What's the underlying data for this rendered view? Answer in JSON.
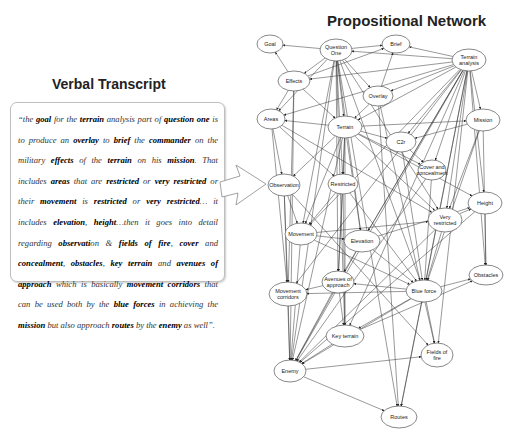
{
  "verbal_transcript": {
    "title": "Verbal Transcript",
    "segments": [
      {
        "t": "“the ",
        "b": false
      },
      {
        "t": "goal",
        "b": true
      },
      {
        "t": " for the ",
        "b": false
      },
      {
        "t": "terrain",
        "b": true
      },
      {
        "t": " analysis part of ",
        "b": false
      },
      {
        "t": "question one",
        "b": true
      },
      {
        "t": " is to produce an ",
        "b": false
      },
      {
        "t": "overlay",
        "b": true
      },
      {
        "t": " to ",
        "b": false
      },
      {
        "t": "brief",
        "b": true
      },
      {
        "t": " the ",
        "b": false
      },
      {
        "t": "commander",
        "b": true
      },
      {
        "t": " on the military ",
        "b": false
      },
      {
        "t": "effects",
        "b": true
      },
      {
        "t": " of the ",
        "b": false
      },
      {
        "t": "terrain",
        "b": true
      },
      {
        "t": " on his ",
        "b": false
      },
      {
        "t": "mission",
        "b": true
      },
      {
        "t": ". That includes ",
        "b": false
      },
      {
        "t": "areas",
        "b": true
      },
      {
        "t": " that are ",
        "b": false
      },
      {
        "t": "restricted",
        "b": true
      },
      {
        "t": " or ",
        "b": false
      },
      {
        "t": "very restricted",
        "b": true
      },
      {
        "t": " or their ",
        "b": false
      },
      {
        "t": "movement",
        "b": true
      },
      {
        "t": " is ",
        "b": false
      },
      {
        "t": "restricted",
        "b": true
      },
      {
        "t": " or ",
        "b": false
      },
      {
        "t": "very restricted",
        "b": true
      },
      {
        "t": "… it includes ",
        "b": false
      },
      {
        "t": "elevation",
        "b": true
      },
      {
        "t": ", ",
        "b": false
      },
      {
        "t": "height",
        "b": true
      },
      {
        "t": "…then it goes into detail regarding ",
        "b": false
      },
      {
        "t": "observati",
        "b": true
      },
      {
        "t": "on & ",
        "b": false
      },
      {
        "t": "fields of fire",
        "b": true
      },
      {
        "t": ", ",
        "b": false
      },
      {
        "t": "cover",
        "b": true
      },
      {
        "t": " and ",
        "b": false
      },
      {
        "t": "concealment",
        "b": true
      },
      {
        "t": ", ",
        "b": false
      },
      {
        "t": "obstacles",
        "b": true
      },
      {
        "t": ", ",
        "b": false
      },
      {
        "t": "key terrain",
        "b": true
      },
      {
        "t": " and ",
        "b": false
      },
      {
        "t": "avenues of approach",
        "b": true
      },
      {
        "t": " which is basically ",
        "b": false
      },
      {
        "t": "movement corridors",
        "b": true
      },
      {
        "t": " that can be used both by the ",
        "b": false
      },
      {
        "t": "blue forces",
        "b": true
      },
      {
        "t": " in achieving the ",
        "b": false
      },
      {
        "t": "mission",
        "b": true
      },
      {
        "t": " but also approach ",
        "b": false
      },
      {
        "t": "routes",
        "b": true
      },
      {
        "t": " by the ",
        "b": false
      },
      {
        "t": "enemy",
        "b": true
      },
      {
        "t": " as well”.",
        "b": false
      }
    ]
  },
  "propositional_network": {
    "title": "Propositional Network",
    "nodes": [
      {
        "id": "goal",
        "label": [
          "Goal"
        ],
        "x": 270,
        "y": 44,
        "rx": 13,
        "ry": 9
      },
      {
        "id": "question_one",
        "label": [
          "Question",
          "One"
        ],
        "x": 336,
        "y": 50,
        "rx": 16,
        "ry": 11
      },
      {
        "id": "brief",
        "label": [
          "Brief"
        ],
        "x": 396,
        "y": 44,
        "rx": 14,
        "ry": 9
      },
      {
        "id": "terrain_analysis",
        "label": [
          "Terrain",
          "analysis"
        ],
        "x": 469,
        "y": 60,
        "rx": 17,
        "ry": 11
      },
      {
        "id": "effects",
        "label": [
          "Effects"
        ],
        "x": 294,
        "y": 81,
        "rx": 16,
        "ry": 10
      },
      {
        "id": "overlay",
        "label": [
          "Overlay"
        ],
        "x": 378,
        "y": 96,
        "rx": 15,
        "ry": 10
      },
      {
        "id": "areas",
        "label": [
          "Areas"
        ],
        "x": 271,
        "y": 119,
        "rx": 14,
        "ry": 10
      },
      {
        "id": "terrain",
        "label": [
          "Terrain"
        ],
        "x": 345,
        "y": 127,
        "rx": 17,
        "ry": 11
      },
      {
        "id": "mission",
        "label": [
          "Mission"
        ],
        "x": 483,
        "y": 120,
        "rx": 17,
        "ry": 11
      },
      {
        "id": "c2",
        "label": [
          "C2r"
        ],
        "x": 401,
        "y": 142,
        "rx": 15,
        "ry": 10
      },
      {
        "id": "cover_concealment",
        "label": [
          "Cover and",
          "concealment"
        ],
        "x": 432,
        "y": 170,
        "rx": 14,
        "ry": 10
      },
      {
        "id": "observation",
        "label": [
          "Observation"
        ],
        "x": 284,
        "y": 185,
        "rx": 16,
        "ry": 11
      },
      {
        "id": "restricted",
        "label": [
          "Restricted"
        ],
        "x": 343,
        "y": 184,
        "rx": 15,
        "ry": 10
      },
      {
        "id": "height",
        "label": [
          "Height"
        ],
        "x": 485,
        "y": 203,
        "rx": 17,
        "ry": 11
      },
      {
        "id": "very_restricted",
        "label": [
          "Very",
          "restricted"
        ],
        "x": 445,
        "y": 220,
        "rx": 17,
        "ry": 12
      },
      {
        "id": "movement",
        "label": [
          "Movement"
        ],
        "x": 301,
        "y": 234,
        "rx": 16,
        "ry": 11
      },
      {
        "id": "elevation",
        "label": [
          "Elevation"
        ],
        "x": 362,
        "y": 241,
        "rx": 18,
        "ry": 11
      },
      {
        "id": "obstacles",
        "label": [
          "Obstacles"
        ],
        "x": 486,
        "y": 275,
        "rx": 17,
        "ry": 10
      },
      {
        "id": "avenues_of_approach",
        "label": [
          "Avenues of",
          "approach"
        ],
        "x": 338,
        "y": 282,
        "rx": 16,
        "ry": 11
      },
      {
        "id": "movement_corridors",
        "label": [
          "Movement",
          "corridors"
        ],
        "x": 288,
        "y": 294,
        "rx": 19,
        "ry": 12
      },
      {
        "id": "blue_force",
        "label": [
          "Blue force"
        ],
        "x": 424,
        "y": 291,
        "rx": 18,
        "ry": 11
      },
      {
        "id": "key_terrain",
        "label": [
          "Key terrain"
        ],
        "x": 345,
        "y": 336,
        "rx": 19,
        "ry": 11
      },
      {
        "id": "fields_of_fire",
        "label": [
          "Fields of",
          "fire"
        ],
        "x": 437,
        "y": 355,
        "rx": 16,
        "ry": 12
      },
      {
        "id": "enemy",
        "label": [
          "Enemy"
        ],
        "x": 290,
        "y": 371,
        "rx": 16,
        "ry": 11
      },
      {
        "id": "routes",
        "label": [
          "Routes"
        ],
        "x": 399,
        "y": 417,
        "rx": 18,
        "ry": 11
      }
    ],
    "edge_labels": [
      "< Ha >",
      "< Mk >",
      "< Ta >",
      "< Hal >",
      "< Gal >",
      "< Ba >",
      "< Has >",
      "< Tal >"
    ],
    "edges": [
      [
        "question_one",
        "goal"
      ],
      [
        "question_one",
        "brief"
      ],
      [
        "terrain_analysis",
        "brief"
      ],
      [
        "terrain_analysis",
        "question_one"
      ],
      [
        "question_one",
        "effects"
      ],
      [
        "question_one",
        "overlay"
      ],
      [
        "question_one",
        "terrain"
      ],
      [
        "question_one",
        "areas"
      ],
      [
        "question_one",
        "restricted"
      ],
      [
        "question_one",
        "movement"
      ],
      [
        "question_one",
        "elevation"
      ],
      [
        "question_one",
        "avenues_of_approach"
      ],
      [
        "question_one",
        "key_terrain"
      ],
      [
        "question_one",
        "blue_force"
      ],
      [
        "question_one",
        "very_restricted"
      ],
      [
        "question_one",
        "enemy"
      ],
      [
        "terrain_analysis",
        "effects"
      ],
      [
        "terrain_analysis",
        "overlay"
      ],
      [
        "terrain_analysis",
        "terrain"
      ],
      [
        "terrain_analysis",
        "mission"
      ],
      [
        "terrain_analysis",
        "areas"
      ],
      [
        "terrain_analysis",
        "c2"
      ],
      [
        "terrain_analysis",
        "cover_concealment"
      ],
      [
        "terrain_analysis",
        "very_restricted"
      ],
      [
        "terrain_analysis",
        "height"
      ],
      [
        "terrain_analysis",
        "obstacles"
      ],
      [
        "terrain_analysis",
        "elevation"
      ],
      [
        "terrain_analysis",
        "movement"
      ],
      [
        "terrain_analysis",
        "blue_force"
      ],
      [
        "terrain_analysis",
        "fields_of_fire"
      ],
      [
        "terrain_analysis",
        "key_terrain"
      ],
      [
        "terrain_analysis",
        "avenues_of_approach"
      ],
      [
        "terrain_analysis",
        "enemy"
      ],
      [
        "terrain_analysis",
        "movement_corridors"
      ],
      [
        "terrain_analysis",
        "routes"
      ],
      [
        "effects",
        "goal"
      ],
      [
        "effects",
        "brief"
      ],
      [
        "effects",
        "terrain"
      ],
      [
        "effects",
        "areas"
      ],
      [
        "overlay",
        "brief"
      ],
      [
        "overlay",
        "terrain"
      ],
      [
        "terrain",
        "areas"
      ],
      [
        "terrain",
        "mission"
      ],
      [
        "terrain",
        "c2"
      ],
      [
        "terrain",
        "restricted"
      ],
      [
        "terrain",
        "observation"
      ],
      [
        "terrain",
        "movement"
      ],
      [
        "terrain",
        "elevation"
      ],
      [
        "terrain",
        "very_restricted"
      ],
      [
        "terrain",
        "cover_concealment"
      ],
      [
        "terrain",
        "height"
      ],
      [
        "terrain",
        "avenues_of_approach"
      ],
      [
        "terrain",
        "key_terrain"
      ],
      [
        "terrain",
        "enemy"
      ],
      [
        "mission",
        "c2"
      ],
      [
        "mission",
        "very_restricted"
      ],
      [
        "mission",
        "blue_force"
      ],
      [
        "mission",
        "obstacles"
      ],
      [
        "areas",
        "observation"
      ],
      [
        "areas",
        "restricted"
      ],
      [
        "areas",
        "movement_corridors"
      ],
      [
        "areas",
        "very_restricted"
      ],
      [
        "observation",
        "movement_corridors"
      ],
      [
        "observation",
        "enemy"
      ],
      [
        "observation",
        "fields_of_fire"
      ],
      [
        "observation",
        "movement"
      ],
      [
        "restricted",
        "movement"
      ],
      [
        "restricted",
        "avenues_of_approach"
      ],
      [
        "restricted",
        "blue_force"
      ],
      [
        "restricted",
        "key_terrain"
      ],
      [
        "movement",
        "very_restricted"
      ],
      [
        "movement",
        "elevation"
      ],
      [
        "movement",
        "enemy"
      ],
      [
        "movement",
        "blue_force"
      ],
      [
        "elevation",
        "height"
      ],
      [
        "elevation",
        "enemy"
      ],
      [
        "elevation",
        "blue_force"
      ],
      [
        "very_restricted",
        "height"
      ],
      [
        "very_restricted",
        "blue_force"
      ],
      [
        "very_restricted",
        "enemy"
      ],
      [
        "height",
        "obstacles"
      ],
      [
        "height",
        "enemy"
      ],
      [
        "c2",
        "cover_concealment"
      ],
      [
        "c2",
        "blue_force"
      ],
      [
        "cover_concealment",
        "blue_force"
      ],
      [
        "cover_concealment",
        "enemy"
      ],
      [
        "blue_force",
        "avenues_of_approach"
      ],
      [
        "blue_force",
        "movement_corridors"
      ],
      [
        "blue_force",
        "key_terrain"
      ],
      [
        "blue_force",
        "obstacles"
      ],
      [
        "blue_force",
        "fields_of_fire"
      ],
      [
        "blue_force",
        "routes"
      ],
      [
        "blue_force",
        "enemy"
      ],
      [
        "avenues_of_approach",
        "movement_corridors"
      ],
      [
        "avenues_of_approach",
        "key_terrain"
      ],
      [
        "avenues_of_approach",
        "enemy"
      ],
      [
        "key_terrain",
        "enemy"
      ],
      [
        "key_terrain",
        "obstacles"
      ],
      [
        "enemy",
        "fields_of_fire"
      ],
      [
        "enemy",
        "routes"
      ],
      [
        "movement_corridors",
        "enemy"
      ],
      [
        "question_one",
        "routes"
      ],
      [
        "overlay",
        "routes"
      ],
      [
        "effects",
        "movement_corridors"
      ],
      [
        "effects",
        "enemy"
      ],
      [
        "overlay",
        "fields_of_fire"
      ]
    ]
  },
  "colors": {
    "line": "#333333",
    "node_fill": "#ffffff",
    "node_stroke": "#555555",
    "callout_stroke": "#8a8a8a"
  }
}
